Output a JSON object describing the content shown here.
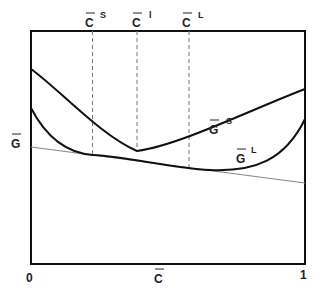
{
  "diagram": {
    "type": "free-energy-composition",
    "x_axis": {
      "label": "C",
      "label_overbar": true,
      "min_label": "0",
      "max_label": "1"
    },
    "y_axis": {
      "label": "G",
      "label_overbar": true
    },
    "top_markers": [
      {
        "label": "C",
        "superscript": "S",
        "x_fraction": 0.224
      },
      {
        "label": "C",
        "superscript": "l",
        "x_fraction": 0.385
      },
      {
        "label": "C",
        "superscript": "L",
        "x_fraction": 0.577
      }
    ],
    "curves": [
      {
        "name": "G",
        "superscript": "S",
        "description": "solid phase free energy curve"
      },
      {
        "name": "G",
        "superscript": "L",
        "description": "liquid phase free energy curve"
      }
    ],
    "common_tangent": {
      "description": "thin gray tangent line touching both curves"
    },
    "colors": {
      "curve": "#111111",
      "tangent": "#888888",
      "dashed": "#777777",
      "frame": "#111111"
    }
  }
}
